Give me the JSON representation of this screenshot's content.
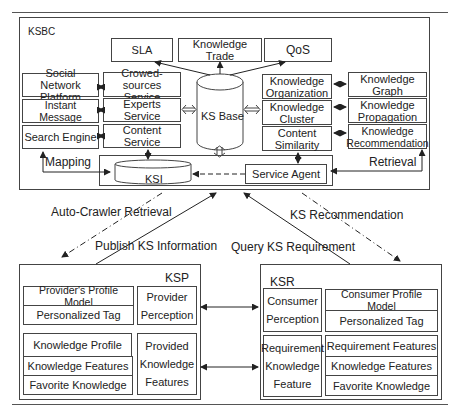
{
  "ksbc": {
    "title": "KSBC",
    "top_boxes": [
      "SLA",
      "Knowledge Trade",
      "QoS"
    ],
    "ks_base": "KS Base",
    "left_platforms": [
      "Social Network Platform",
      "Instant Message",
      "Search Engine"
    ],
    "services": [
      "Crowed-sources Service",
      "Experts Service",
      "Content Service"
    ],
    "knowledge_ops": [
      "Knowledge Organization",
      "Knowledge Cluster",
      "Content Similarity"
    ],
    "knowledge_outputs": [
      "Knowledge Graph",
      "Knowledge Propagation",
      "Knowledge Recommendation"
    ],
    "ksi": "KSI",
    "service_agent": "Service Agent",
    "mapping": "Mapping",
    "retrieval": "Retrieval"
  },
  "flows": {
    "auto_crawler": "Auto-Crawler Retrieval",
    "ks_recommendation": "KS Recommendation",
    "publish": "Publish KS Information",
    "query": "Query KS Requirement"
  },
  "ksp": {
    "title": "KSP",
    "profile_model": "Provider's Profile Model",
    "personalized_tag": "Personalized Tag",
    "perception": "Provider Perception",
    "knowledge_profile": "Knowledge Profile",
    "knowledge_features": "Knowledge Features",
    "favorite_knowledge": "Favorite Knowledge",
    "provided_features": "Provided Knowledge Features"
  },
  "ksr": {
    "title": "KSR",
    "perception": "Consumer Perception",
    "profile_model": "Consumer Profile Model",
    "personalized_tag": "Personalized Tag",
    "requirement_feature": "Requirement Knowledge Feature",
    "requirement_features": "Requirement Features",
    "knowledge_features": "Knowledge Features",
    "favorite_knowledge": "Favorite Knowledge"
  }
}
